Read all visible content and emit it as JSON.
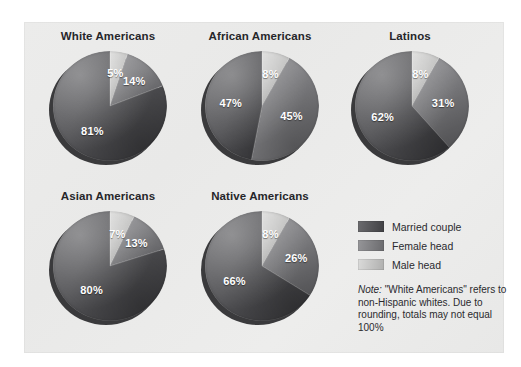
{
  "figure": {
    "background_color": "#eaeae9",
    "legend": {
      "items": [
        {
          "label": "Married couple",
          "color": "#545457",
          "key": "married_couple"
        },
        {
          "label": "Female head",
          "color": "#7e7e81",
          "key": "female_head"
        },
        {
          "label": "Male head",
          "color": "#c3c3c2",
          "key": "male_head"
        }
      ]
    },
    "note": {
      "lead": "Note:",
      "text": " \"White Americans\" refers to non-Hispanic whites. Due to rounding, totals may not equal 100%"
    }
  },
  "chart_data": {
    "type": "pie",
    "title": "",
    "legend_position": "right",
    "categories": [
      "Male head",
      "Female head",
      "Married couple"
    ],
    "colors": {
      "married_couple": "#545457",
      "female_head": "#7e7e81",
      "male_head": "#c3c3c2"
    },
    "start_angle": 0,
    "direction": "clockwise",
    "units": "percent",
    "charts": [
      {
        "title": "White Americans",
        "slices": [
          {
            "name": "Male head",
            "value": 5,
            "label": "5%"
          },
          {
            "name": "Female head",
            "value": 14,
            "label": "14%"
          },
          {
            "name": "Married couple",
            "value": 81,
            "label": "81%"
          }
        ]
      },
      {
        "title": "African Americans",
        "slices": [
          {
            "name": "Male head",
            "value": 8,
            "label": "8%"
          },
          {
            "name": "Female head",
            "value": 45,
            "label": "45%"
          },
          {
            "name": "Married couple",
            "value": 47,
            "label": "47%"
          }
        ]
      },
      {
        "title": "Latinos",
        "slices": [
          {
            "name": "Male head",
            "value": 8,
            "label": "8%"
          },
          {
            "name": "Female head",
            "value": 31,
            "label": "31%"
          },
          {
            "name": "Married couple",
            "value": 62,
            "label": "62%"
          }
        ]
      },
      {
        "title": "Asian Americans",
        "slices": [
          {
            "name": "Male head",
            "value": 7,
            "label": "7%"
          },
          {
            "name": "Female head",
            "value": 13,
            "label": "13%"
          },
          {
            "name": "Married couple",
            "value": 80,
            "label": "80%"
          }
        ]
      },
      {
        "title": "Native Americans",
        "slices": [
          {
            "name": "Male head",
            "value": 8,
            "label": "8%"
          },
          {
            "name": "Female head",
            "value": 26,
            "label": "26%"
          },
          {
            "name": "Married couple",
            "value": 66,
            "label": "66%"
          }
        ]
      }
    ]
  }
}
